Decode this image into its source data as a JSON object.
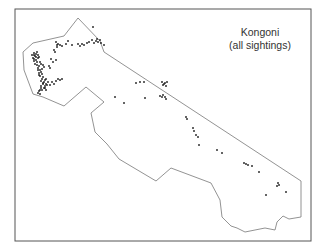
{
  "map": {
    "title_line1": "Kongoni",
    "title_line2": "(all sightings)",
    "frame": {
      "x": 15,
      "y": 9,
      "w": 296,
      "h": 232,
      "color": "#555555"
    },
    "boundary_color": "#777777",
    "dot_color": "#111111",
    "boundary": [
      [
        78,
        18
      ],
      [
        100,
        41
      ],
      [
        104,
        52
      ],
      [
        301,
        181
      ],
      [
        301,
        217
      ],
      [
        289,
        219
      ],
      [
        283,
        216
      ],
      [
        277,
        222
      ],
      [
        275,
        230
      ],
      [
        265,
        228
      ],
      [
        255,
        230
      ],
      [
        245,
        232
      ],
      [
        237,
        228
      ],
      [
        231,
        226
      ],
      [
        222,
        217
      ],
      [
        220,
        200
      ],
      [
        211,
        183
      ],
      [
        171,
        168
      ],
      [
        156,
        181
      ],
      [
        119,
        159
      ],
      [
        107,
        144
      ],
      [
        95,
        132
      ],
      [
        91,
        113
      ],
      [
        104,
        102
      ],
      [
        86,
        87
      ],
      [
        64,
        106
      ],
      [
        43,
        97
      ],
      [
        33,
        94
      ],
      [
        24,
        70
      ],
      [
        23,
        52
      ],
      [
        33,
        43
      ],
      [
        64,
        36
      ]
    ],
    "sightings": [
      [
        34,
        53
      ],
      [
        35,
        56
      ],
      [
        36,
        57
      ],
      [
        34,
        59
      ],
      [
        36,
        60
      ],
      [
        38,
        58
      ],
      [
        37,
        62
      ],
      [
        35,
        64
      ],
      [
        37,
        65
      ],
      [
        39,
        66
      ],
      [
        38,
        68
      ],
      [
        40,
        70
      ],
      [
        42,
        69
      ],
      [
        41,
        72
      ],
      [
        39,
        73
      ],
      [
        42,
        74
      ],
      [
        40,
        76
      ],
      [
        43,
        77
      ],
      [
        42,
        79
      ],
      [
        41,
        81
      ],
      [
        44,
        82
      ],
      [
        45,
        80
      ],
      [
        43,
        84
      ],
      [
        45,
        86
      ],
      [
        47,
        85
      ],
      [
        44,
        88
      ],
      [
        46,
        90
      ],
      [
        42,
        90
      ],
      [
        41,
        88
      ],
      [
        40,
        90
      ],
      [
        39,
        91
      ],
      [
        38,
        93
      ],
      [
        40,
        94
      ],
      [
        45,
        88
      ],
      [
        46,
        84
      ],
      [
        48,
        82
      ],
      [
        52,
        82
      ],
      [
        50,
        85
      ],
      [
        54,
        84
      ],
      [
        56,
        81
      ],
      [
        58,
        79
      ],
      [
        60,
        80
      ],
      [
        62,
        79
      ],
      [
        50,
        68
      ],
      [
        53,
        62
      ],
      [
        56,
        60
      ],
      [
        54,
        50
      ],
      [
        55,
        52
      ],
      [
        57,
        47
      ],
      [
        58,
        44
      ],
      [
        56,
        42
      ],
      [
        57,
        45
      ],
      [
        60,
        45
      ],
      [
        62,
        46
      ],
      [
        66,
        44
      ],
      [
        68,
        41
      ],
      [
        72,
        45
      ],
      [
        78,
        44
      ],
      [
        80,
        46
      ],
      [
        82,
        44
      ],
      [
        84,
        45
      ],
      [
        87,
        43
      ],
      [
        89,
        42
      ],
      [
        92,
        40
      ],
      [
        94,
        43
      ],
      [
        96,
        41
      ],
      [
        97,
        39
      ],
      [
        98,
        42
      ],
      [
        100,
        40
      ],
      [
        101,
        43
      ],
      [
        104,
        45
      ],
      [
        93,
        27
      ],
      [
        37,
        52
      ],
      [
        38,
        55
      ],
      [
        39,
        57
      ],
      [
        36,
        54
      ],
      [
        34,
        55
      ],
      [
        32,
        55
      ],
      [
        40,
        62
      ],
      [
        41,
        64
      ],
      [
        43,
        65
      ],
      [
        44,
        67
      ],
      [
        38,
        70
      ],
      [
        39,
        75
      ],
      [
        41,
        86
      ],
      [
        43,
        83
      ],
      [
        46,
        79
      ],
      [
        49,
        66
      ],
      [
        51,
        59
      ],
      [
        34,
        61
      ],
      [
        33,
        58
      ],
      [
        136,
        83
      ],
      [
        140,
        82
      ],
      [
        144,
        82
      ],
      [
        162,
        82
      ],
      [
        164,
        84
      ],
      [
        165,
        83
      ],
      [
        166,
        86
      ],
      [
        167,
        82
      ],
      [
        163,
        85
      ],
      [
        160,
        96
      ],
      [
        162,
        97
      ],
      [
        163,
        95
      ],
      [
        165,
        97
      ],
      [
        166,
        99
      ],
      [
        115,
        97
      ],
      [
        124,
        103
      ],
      [
        145,
        98
      ],
      [
        186,
        117
      ],
      [
        187,
        119
      ],
      [
        193,
        128
      ],
      [
        194,
        131
      ],
      [
        196,
        135
      ],
      [
        198,
        137
      ],
      [
        199,
        145
      ],
      [
        217,
        150
      ],
      [
        222,
        153
      ],
      [
        244,
        163
      ],
      [
        246,
        164
      ],
      [
        248,
        165
      ],
      [
        252,
        166
      ],
      [
        259,
        172
      ],
      [
        278,
        183
      ],
      [
        279,
        185
      ],
      [
        277,
        186
      ],
      [
        286,
        192
      ],
      [
        266,
        195
      ]
    ]
  }
}
